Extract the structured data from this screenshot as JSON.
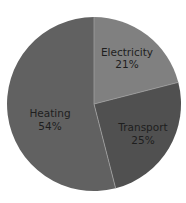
{
  "chart_data": {
    "type": "pie",
    "title": "",
    "categories": [
      "Electricity",
      "Transport",
      "Heating"
    ],
    "values": [
      21,
      25,
      54
    ],
    "unit": "%",
    "labels": [
      "21%",
      "25%",
      "54%"
    ],
    "colors": [
      "#808080",
      "#505050",
      "#616161"
    ],
    "start_angle_deg": 0,
    "direction": "clockwise",
    "legend": "none",
    "label_position": "inside"
  },
  "slices": [
    {
      "name": "Electricity",
      "pct_label": "21%"
    },
    {
      "name": "Transport",
      "pct_label": "25%"
    },
    {
      "name": "Heating",
      "pct_label": "54%"
    }
  ],
  "style": {
    "divider_color": "#a0a0a0",
    "text_color": "#1e1e1e",
    "background": "#ffffff"
  }
}
